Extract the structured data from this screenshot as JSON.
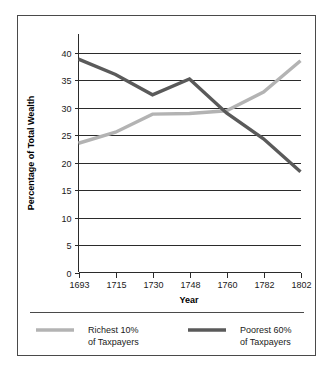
{
  "chart_data": {
    "type": "line",
    "title": "",
    "xlabel": "Year",
    "ylabel": "Percentage of Total Wealth",
    "x": [
      1693,
      1715,
      1730,
      1748,
      1760,
      1782,
      1802
    ],
    "xtick_labels": [
      "1693",
      "1715",
      "1730",
      "1748",
      "1760",
      "1782",
      "1802"
    ],
    "ytick_labels": [
      "0",
      "5",
      "10",
      "15",
      "20",
      "25",
      "30",
      "35",
      "40"
    ],
    "yticks": [
      0,
      5,
      10,
      15,
      20,
      25,
      30,
      35,
      40
    ],
    "ylim": [
      0,
      40
    ],
    "grid": "horizontal",
    "legend_position": "below",
    "series": [
      {
        "name": "Richest 10% of Taxpayers",
        "name_line1": "Richest 10%",
        "name_line2": "of Taxpayers",
        "color": "#b3b3b3",
        "values": [
          23.5,
          25.5,
          28.8,
          28.9,
          29.4,
          32.8,
          38.5
        ]
      },
      {
        "name": "Poorest 60% of Taxpayers",
        "name_line1": "Poorest 60%",
        "name_line2": "of Taxpayers",
        "color": "#5a5a5a",
        "values": [
          38.8,
          36.0,
          32.3,
          35.2,
          29.0,
          24.3,
          18.3
        ]
      }
    ]
  },
  "legend": {
    "entries": [
      {
        "line1": "Richest 10%",
        "line2": "of Taxpayers",
        "swatch": "richest-swatch"
      },
      {
        "line1": "Poorest 60%",
        "line2": "of Taxpayers",
        "swatch": "poorest-swatch"
      }
    ]
  },
  "axes": {
    "x_title": "Year",
    "y_title": "Percentage of Total Wealth"
  }
}
